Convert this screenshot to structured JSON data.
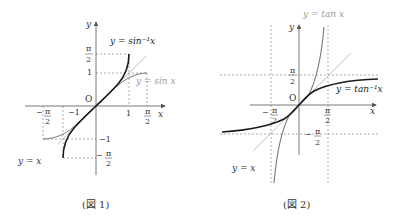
{
  "figures": [
    {
      "caption": "(図 1)",
      "axis_x_label": "x",
      "axis_y_label": "y",
      "origin_label": "O",
      "curve_labels": {
        "inverse": "y = sin⁻¹x",
        "base": "y = sin x",
        "identity": "y = x"
      },
      "x_ticks": [
        "−π/2",
        "−1",
        "1",
        "π/2"
      ],
      "y_ticks": [
        "π/2",
        "1",
        "−1",
        "−π/2"
      ]
    },
    {
      "caption": "(図 2)",
      "axis_x_label": "x",
      "axis_y_label": "y",
      "origin_label": "O",
      "curve_labels": {
        "inverse": "y = tan⁻¹x",
        "base": "y = tan x",
        "identity": "y = x"
      },
      "x_ticks": [
        "−π/2",
        "π/2"
      ],
      "y_ticks": [
        "π/2",
        "−π/2"
      ]
    }
  ],
  "colors": {
    "inverse": "#1a1a1a",
    "base": "#777777",
    "identity": "#bbbbbb",
    "axis": "#555555",
    "dashed": "#888888"
  }
}
